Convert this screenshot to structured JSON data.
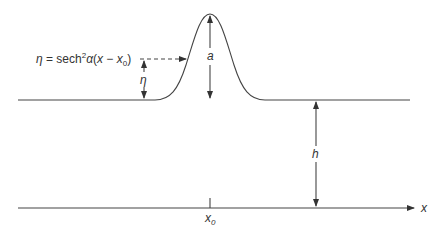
{
  "diagram": {
    "equation": {
      "lhs": "η",
      "eq": " = sech",
      "sup": "2",
      "alpha": "α",
      "paren_open": "(",
      "x": "x",
      "minus": " − ",
      "x0": "x",
      "x0_sub": "0",
      "paren_close": ")"
    },
    "labels": {
      "eta": "η",
      "amplitude": "a",
      "depth": "h",
      "x_axis": "x",
      "crest_position": "x",
      "crest_position_sub": "0"
    },
    "colors": {
      "line": "#444444",
      "text": "#333333",
      "background": "#ffffff"
    }
  }
}
